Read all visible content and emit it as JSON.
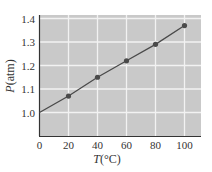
{
  "chart_data": {
    "type": "line",
    "title": "",
    "xlabel": "T(°C)",
    "ylabel": "P(atm)",
    "xlabel_italic_part": "T",
    "xlabel_rest": "(°C)",
    "ylabel_italic_part": "P",
    "ylabel_rest": "(atm)",
    "x": [
      0,
      20,
      40,
      60,
      80,
      100
    ],
    "series": [
      {
        "name": "Pressure",
        "line_x": [
          0,
          20,
          40,
          60,
          80,
          100
        ],
        "line_y": [
          1.0,
          1.07,
          1.15,
          1.22,
          1.29,
          1.37
        ],
        "markers_x": [
          20,
          40,
          60,
          80,
          100
        ],
        "markers_y": [
          1.07,
          1.15,
          1.22,
          1.29,
          1.37
        ]
      }
    ],
    "xticks": [
      "0",
      "20",
      "40",
      "60",
      "80",
      "100"
    ],
    "yticks": [
      "1.0",
      "1.1",
      "1.2",
      "1.3",
      "1.4"
    ],
    "xlim": [
      0,
      110
    ],
    "ylim": [
      0.9,
      1.41
    ],
    "grid": true,
    "legend": null,
    "colors": {
      "plot_bg": "#c9c9c9",
      "grid": "#f2f2f2",
      "line": "#4a4a4a",
      "marker": "#4a4a4a",
      "axis": "#333333"
    }
  }
}
